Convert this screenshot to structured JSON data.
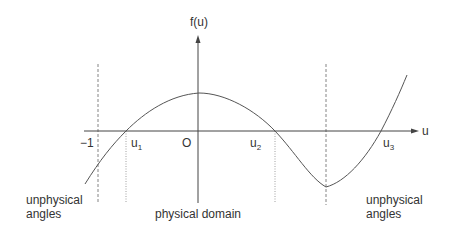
{
  "diagram": {
    "type": "function-plot",
    "vertical_axis_label": "f(u)",
    "horizontal_axis_label": "u",
    "origin_label": "O",
    "tick_labels": {
      "minus_one": "−1",
      "u1": {
        "base": "u",
        "sub": "1"
      },
      "u2": {
        "base": "u",
        "sub": "2"
      },
      "u3": {
        "base": "u",
        "sub": "3"
      }
    },
    "region_labels": {
      "left": {
        "line1": "unphysical",
        "line2": "angles"
      },
      "center": "physical domain",
      "right": {
        "line1": "unphysical",
        "line2": "angles"
      }
    },
    "colors": {
      "curve": "#555555",
      "axes": "#444444",
      "guides": "#666666",
      "text": "#333333"
    }
  }
}
